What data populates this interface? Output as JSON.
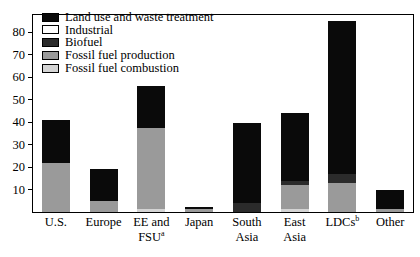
{
  "chart_data": {
    "type": "bar",
    "subtype": "stacked",
    "title": "",
    "subtitle": "",
    "xlabel": "",
    "ylabel": "",
    "grid": false,
    "legend_position": "top-left",
    "ylim": [
      0,
      88
    ],
    "yticks": [
      10,
      20,
      30,
      40,
      50,
      60,
      70,
      80
    ],
    "ytick_labels": [
      "10",
      "20",
      "30",
      "40",
      "50",
      "60",
      "70",
      "80"
    ],
    "categories": [
      "U.S.",
      "Europe",
      "EE and FSU",
      "Japan",
      "South Asia",
      "East Asia",
      "LDCs",
      "Other"
    ],
    "category_label_lines": [
      [
        "U.S."
      ],
      [
        "Europe"
      ],
      [
        "EE and",
        "FSU"
      ],
      [
        "Japan"
      ],
      [
        "South",
        "Asia"
      ],
      [
        "East",
        "Asia"
      ],
      [
        "LDCs"
      ],
      [
        "Other"
      ]
    ],
    "category_footnotes": [
      "",
      "",
      "a",
      "",
      "",
      "",
      "b",
      ""
    ],
    "series": [
      {
        "name": "Fossil fuel combustion",
        "color": "#d4d4d4",
        "values": [
          0,
          0,
          1.5,
          0,
          0,
          1.5,
          0,
          0
        ]
      },
      {
        "name": "Fossil fuel production",
        "color": "#9a9a9a",
        "values": [
          22,
          5,
          36,
          1.3,
          0,
          10.5,
          13,
          1.5
        ]
      },
      {
        "name": "Biofuel",
        "color": "#2b2b2b",
        "values": [
          0,
          0,
          0,
          0,
          4,
          2,
          4,
          0
        ]
      },
      {
        "name": "Industrial",
        "color": "#ffffff",
        "values": [
          0,
          0,
          0,
          0,
          0,
          0,
          0,
          0
        ]
      },
      {
        "name": "Land use and waste treatment",
        "color": "#0a0a0a",
        "values": [
          19,
          14.2,
          18.5,
          1.0,
          35.5,
          30,
          68,
          8.5
        ]
      }
    ],
    "totals": [
      41,
      19.2,
      56,
      2.3,
      39.5,
      44,
      85,
      10
    ],
    "legend_entries": [
      {
        "label": "Land use and waste treatment",
        "color": "#0a0a0a"
      },
      {
        "label": "Industrial",
        "color": "#ffffff"
      },
      {
        "label": "Biofuel",
        "color": "#2b2b2b"
      },
      {
        "label": "Fossil fuel production",
        "color": "#9a9a9a"
      },
      {
        "label": "Fossil fuel combustion",
        "color": "#d4d4d4"
      }
    ]
  }
}
